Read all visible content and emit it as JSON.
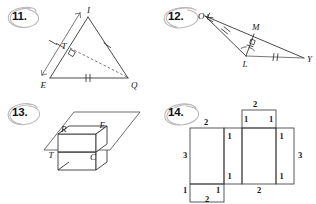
{
  "page": {
    "background_color": "#ffffff",
    "ink_color": "#2a2a2a",
    "annotation_color": "#b9b6b8"
  },
  "problems": [
    {
      "number": "11.",
      "figure_type": "triangle-with-cevian",
      "description": "Triangle with vertices I, E, Q; point T on side IE; right angle at T; dashed segment from T to Q",
      "vertex_labels": [
        "I",
        "T",
        "E",
        "Q"
      ],
      "marks": {
        "single_tick_segments": [
          "IT",
          "TE",
          "IQ"
        ],
        "double_tick_segments": [
          "EQ"
        ],
        "right_angle_at": "T",
        "dashed_segments": [
          "TQ"
        ],
        "arrow_segments": [
          "IE"
        ]
      }
    },
    {
      "number": "12.",
      "figure_type": "triangle-with-altitude",
      "description": "Triangle O, L, Y with point M on segment OY; segment ML drawn; right angle at M; congruent angles at L",
      "vertex_labels": [
        "O",
        "M",
        "L",
        "Y"
      ],
      "marks": {
        "double_tick_segments": [
          "OL",
          "LY"
        ],
        "single_tick_segments": [
          "LM"
        ],
        "right_angle_at": "M",
        "angle_marks_at": [
          "L"
        ]
      }
    },
    {
      "number": "13.",
      "figure_type": "prism-intersecting-plane",
      "description": "Rectangular box passing through a plane; the cross-section rectangle is labeled R, E, T, C",
      "vertex_labels": [
        "R",
        "E",
        "T",
        "C"
      ]
    },
    {
      "number": "14.",
      "figure_type": "net-of-rectangular-prism",
      "description": "Net of a rectangular prism with edge lengths labeled",
      "edge_labels": [
        "2",
        "2",
        "1",
        "1",
        "3",
        "1",
        "1",
        "1",
        "1",
        "3",
        "2",
        "1",
        "1",
        "2"
      ],
      "dimensions": {
        "length": 3,
        "width": 2,
        "height": 1
      }
    }
  ],
  "figure11": {
    "labels": {
      "I": "I",
      "T": "T",
      "E": "E",
      "Q": "Q"
    }
  },
  "figure12": {
    "labels": {
      "O": "O",
      "M": "M",
      "L": "L",
      "Y": "Y"
    }
  },
  "figure13": {
    "labels": {
      "R": "R",
      "E": "E",
      "T": "T",
      "C": "C"
    }
  },
  "figure14": {
    "labels": {
      "top_mid": "2",
      "left_top": "2",
      "left_side": "3",
      "mid_left_upper": "1",
      "mid_left_lower": "1",
      "top_flap_left": "1",
      "top_flap_right": "1",
      "right_upper": "1",
      "right_lower": "1",
      "right_side": "3",
      "bottom_center": "2",
      "bottom_flap_left": "1",
      "bottom_flap_right": "1",
      "bottom_mid": "2"
    }
  }
}
